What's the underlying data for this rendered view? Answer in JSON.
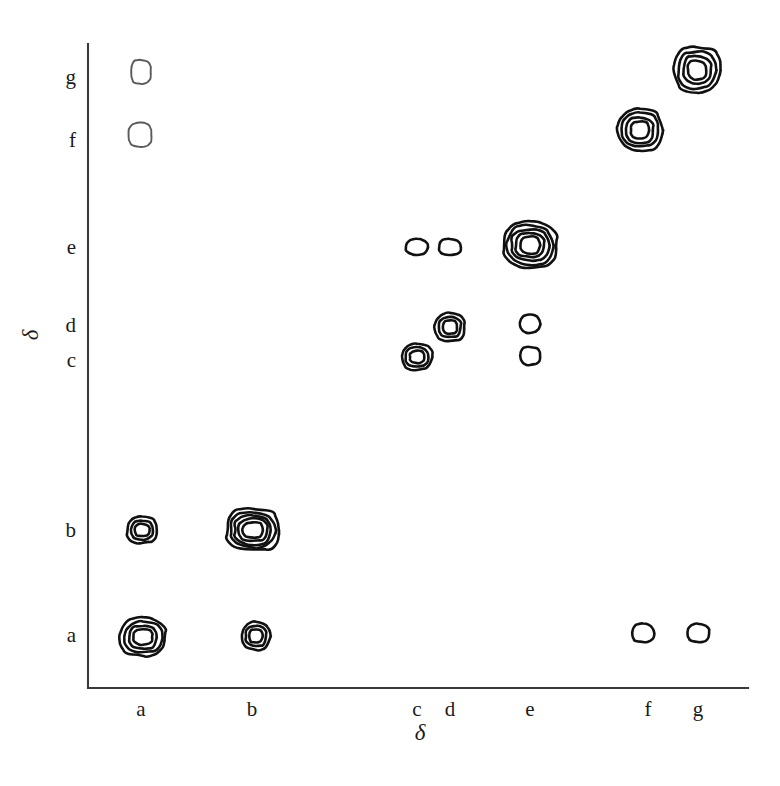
{
  "chart_data": {
    "type": "scatter",
    "subtype": "2d-contour-correlation-spectrum",
    "title": "",
    "subtitle": "",
    "xlabel": "δ",
    "ylabel": "δ",
    "grid": false,
    "legend": null,
    "legend_position": "none",
    "background_color": "#ffffff",
    "contour_color": "#111111",
    "faint_contour_color": "#5a5a5a",
    "axis_color": "#3a3a3a",
    "x_categories": [
      "a",
      "b",
      "c",
      "d",
      "e",
      "f",
      "g"
    ],
    "y_categories": [
      "a",
      "b",
      "c",
      "d",
      "e",
      "f",
      "g"
    ],
    "x_tick_labels": [
      "a",
      "b",
      "c",
      "d",
      "e",
      "f",
      "g"
    ],
    "y_tick_labels": [
      "g",
      "f",
      "e",
      "d",
      "c",
      "b",
      "a"
    ],
    "x_tick_positions_px": [
      141,
      252,
      417,
      450,
      530,
      648,
      698
    ],
    "y_tick_positions_px": [
      77,
      140,
      247,
      325,
      360,
      530,
      635
    ],
    "xlim_px": [
      88,
      748
    ],
    "ylim_px": [
      44,
      688
    ],
    "peaks": [
      {
        "id": "a-g",
        "x": "a",
        "y": "g",
        "cx": 141,
        "cy": 72,
        "rx": 10,
        "ry": 12,
        "rings": 1,
        "intensity": 1,
        "faint": true
      },
      {
        "id": "a-f",
        "x": "a",
        "y": "f",
        "cx": 140,
        "cy": 135,
        "rx": 12,
        "ry": 12,
        "rings": 1,
        "intensity": 1,
        "faint": true
      },
      {
        "id": "f-f",
        "x": "f",
        "y": "f",
        "cx": 640,
        "cy": 130,
        "rx": 22,
        "ry": 21,
        "rings": 4,
        "intensity": 4,
        "faint": false
      },
      {
        "id": "g-g",
        "x": "g",
        "y": "g",
        "cx": 697,
        "cy": 70,
        "rx": 23,
        "ry": 23,
        "rings": 4,
        "intensity": 4,
        "faint": false
      },
      {
        "id": "c-e",
        "x": "c",
        "y": "e",
        "cx": 417,
        "cy": 247,
        "rx": 11,
        "ry": 8,
        "rings": 1,
        "intensity": 1,
        "faint": false
      },
      {
        "id": "d-e",
        "x": "d",
        "y": "e",
        "cx": 450,
        "cy": 247,
        "rx": 11,
        "ry": 8,
        "rings": 1,
        "intensity": 1,
        "faint": false
      },
      {
        "id": "e-e",
        "x": "e",
        "y": "e",
        "cx": 530,
        "cy": 245,
        "rx": 27,
        "ry": 23,
        "rings": 5,
        "intensity": 5,
        "faint": false
      },
      {
        "id": "d-d",
        "x": "d",
        "y": "d",
        "cx": 450,
        "cy": 327,
        "rx": 15,
        "ry": 14,
        "rings": 3,
        "intensity": 3,
        "faint": false
      },
      {
        "id": "e-d",
        "x": "e",
        "y": "d",
        "cx": 530,
        "cy": 324,
        "rx": 10,
        "ry": 9,
        "rings": 1,
        "intensity": 1,
        "faint": false
      },
      {
        "id": "c-c",
        "x": "c",
        "y": "c",
        "cx": 417,
        "cy": 357,
        "rx": 15,
        "ry": 13,
        "rings": 3,
        "intensity": 3,
        "faint": false
      },
      {
        "id": "e-c",
        "x": "e",
        "y": "c",
        "cx": 530,
        "cy": 356,
        "rx": 10,
        "ry": 9,
        "rings": 1,
        "intensity": 1,
        "faint": false
      },
      {
        "id": "a-b",
        "x": "a",
        "y": "b",
        "cx": 142,
        "cy": 530,
        "rx": 15,
        "ry": 13,
        "rings": 3,
        "intensity": 3,
        "faint": false
      },
      {
        "id": "b-b",
        "x": "b",
        "y": "b",
        "cx": 253,
        "cy": 530,
        "rx": 27,
        "ry": 21,
        "rings": 5,
        "intensity": 5,
        "faint": false
      },
      {
        "id": "a-a",
        "x": "a",
        "y": "a",
        "cx": 143,
        "cy": 637,
        "rx": 23,
        "ry": 19,
        "rings": 4,
        "intensity": 4,
        "faint": false
      },
      {
        "id": "b-a",
        "x": "b",
        "y": "a",
        "cx": 256,
        "cy": 636,
        "rx": 14,
        "ry": 14,
        "rings": 3,
        "intensity": 3,
        "faint": false
      },
      {
        "id": "f-a",
        "x": "f",
        "y": "a",
        "cx": 643,
        "cy": 633,
        "rx": 11,
        "ry": 9,
        "rings": 1,
        "intensity": 1,
        "faint": false
      },
      {
        "id": "g-a",
        "x": "g",
        "y": "a",
        "cx": 698,
        "cy": 633,
        "rx": 11,
        "ry": 9,
        "rings": 1,
        "intensity": 1,
        "faint": false
      }
    ]
  },
  "axes": {
    "x_title": "δ",
    "y_title": "δ",
    "x_title_position_px": [
      420,
      740
    ],
    "y_title_position_px": [
      38,
      335
    ]
  }
}
